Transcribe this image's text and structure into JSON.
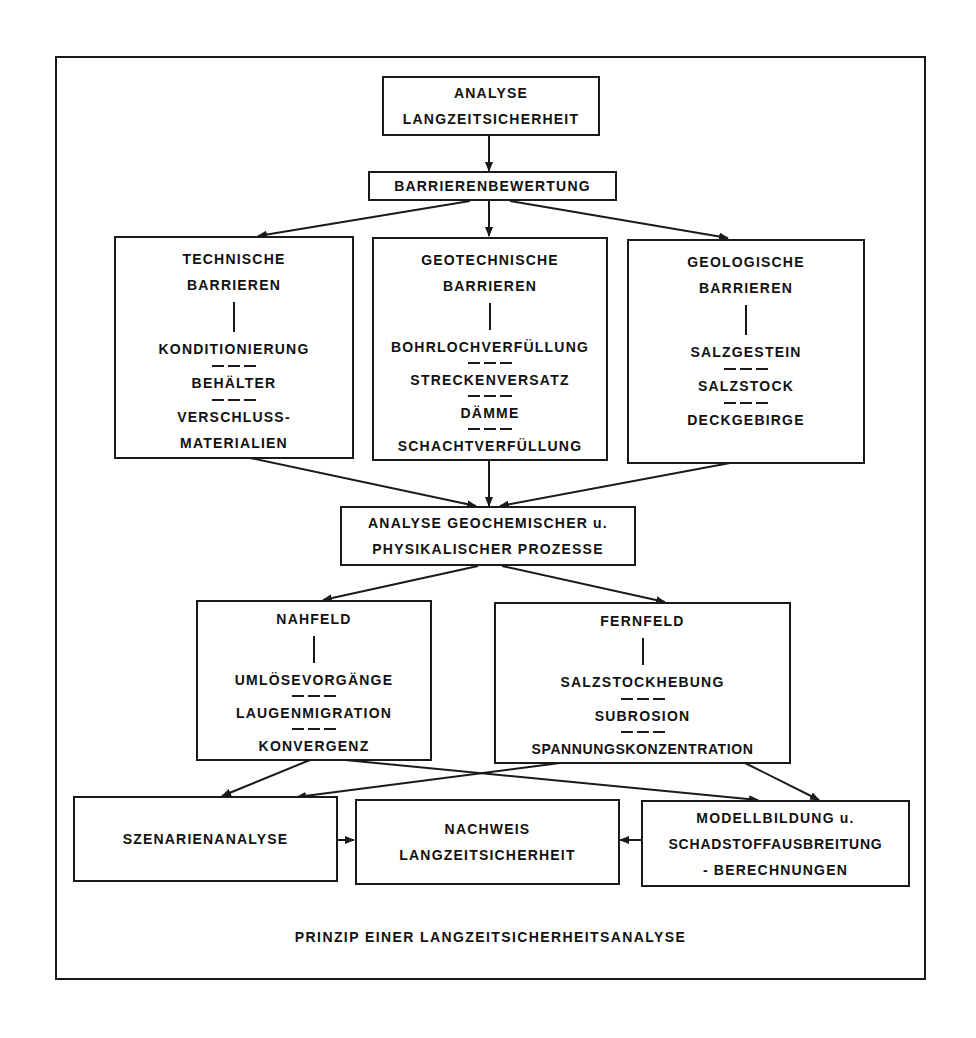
{
  "diagram": {
    "root": {
      "lines": [
        "ANALYSE",
        "LANGZEITSICHERHEIT"
      ]
    },
    "evaluation": {
      "label": "BARRIERENBEWERTUNG"
    },
    "barriers": [
      {
        "title": [
          "TECHNISCHE",
          "BARRIEREN"
        ],
        "items": [
          "KONDITIONIERUNG",
          "BEHÄLTER",
          "VERSCHLUSS- MATERIALIEN"
        ],
        "item_lines": [
          [
            "KONDITIONIERUNG"
          ],
          [
            "BEHÄLTER"
          ],
          [
            "VERSCHLUSS-",
            "MATERIALIEN"
          ]
        ]
      },
      {
        "title": [
          "GEOTECHNISCHE",
          "BARRIEREN"
        ],
        "item_lines": [
          [
            "BOHRLOCHVERFÜLLUNG"
          ],
          [
            "STRECKENVERSATZ"
          ],
          [
            "DÄMME"
          ],
          [
            "SCHACHTVERFÜLLUNG"
          ]
        ]
      },
      {
        "title": [
          "GEOLOGISCHE",
          "BARRIEREN"
        ],
        "item_lines": [
          [
            "SALZGESTEIN"
          ],
          [
            "SALZSTOCK"
          ],
          [
            "DECKGEBIRGE"
          ]
        ]
      }
    ],
    "process_analysis": {
      "lines": [
        "ANALYSE GEOCHEMISCHER u.",
        "PHYSIKALISCHER PROZESSE"
      ]
    },
    "fields": [
      {
        "title": "NAHFELD",
        "items": [
          "UMLÖSEVORGÄNGE",
          "LAUGENMIGRATION",
          "KONVERGENZ"
        ]
      },
      {
        "title": "FERNFELD",
        "items": [
          "SALZSTOCKHEBUNG",
          "SUBROSION",
          "SPANNUNGSKONZENTRATION"
        ]
      }
    ],
    "bottom": {
      "scenario": {
        "label": "SZENARIENANALYSE"
      },
      "proof": {
        "lines": [
          "NACHWEIS",
          "LANGZEITSICHERHEIT"
        ]
      },
      "model": {
        "lines": [
          "MODELLBILDUNG u.",
          "SCHADSTOFFAUSBREITUNG",
          "- BERECHNUNGEN"
        ]
      }
    },
    "caption": "PRINZIP EINER LANGZEITSICHERHEITSANALYSE",
    "colors": {
      "line": "#1a1a1a",
      "background": "#ffffff"
    }
  }
}
